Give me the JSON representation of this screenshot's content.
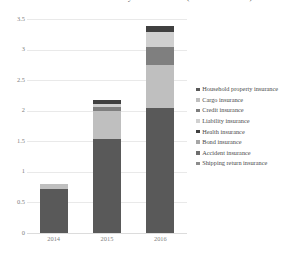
{
  "chart_data": {
    "type": "bar",
    "subtype": "stacked-column",
    "title": "Gross Premium Income by Insurance Line (RMB 100 million)",
    "xlabel": "",
    "ylabel": "",
    "categories": [
      "2014",
      "2015",
      "2016"
    ],
    "ylim": [
      0,
      3.5
    ],
    "yticks": [
      0,
      0.5,
      1,
      1.5,
      2,
      2.5,
      3,
      3.5
    ],
    "ytick_labels": [
      "0",
      "0.5",
      "1",
      "1.5",
      "2",
      "2.5",
      "3",
      "3.5"
    ],
    "grid": true,
    "legend_position": "right",
    "series": [
      {
        "name": "Household property insurance",
        "color": "#595959",
        "values": [
          0.72,
          1.53,
          2.05
        ]
      },
      {
        "name": "Cargo insurance",
        "color": "#bfbfbf",
        "values": [
          0.08,
          0.47,
          0.7
        ]
      },
      {
        "name": "Credit insurance",
        "color": "#7f7f7f",
        "values": [
          0.0,
          0.06,
          0.3
        ]
      },
      {
        "name": "Liability insurance",
        "color": "#d0d0d0",
        "values": [
          0.0,
          0.05,
          0.23
        ]
      },
      {
        "name": "Health insurance",
        "color": "#404040",
        "values": [
          0.0,
          0.07,
          0.11
        ]
      },
      {
        "name": "Bond insurance",
        "color": "#a6a6a6",
        "values": [
          0.0,
          0.0,
          0.0
        ]
      },
      {
        "name": "Accident insurance",
        "color": "#6e6e6e",
        "values": [
          0.0,
          0.0,
          0.0
        ]
      },
      {
        "name": "Shipping return insurance",
        "color": "#8c8c8c",
        "values": [
          0.0,
          0.0,
          0.0
        ]
      }
    ],
    "totals": [
      0.8,
      2.18,
      3.39
    ]
  },
  "legend": {
    "items": [
      {
        "label": "Household property insurance",
        "marker": "square-marker"
      },
      {
        "label": "Cargo insurance",
        "marker": "square-marker"
      },
      {
        "label": "Credit insurance",
        "marker": "square-marker"
      },
      {
        "label": "Liability insurance",
        "marker": "square-marker"
      },
      {
        "label": "Health insurance",
        "marker": "square-marker"
      },
      {
        "label": "Bond insurance",
        "marker": "square-marker"
      },
      {
        "label": "Accident insurance",
        "marker": "square-marker"
      },
      {
        "label": "Shipping return insurance",
        "marker": "square-marker"
      }
    ]
  },
  "colors": {
    "grid": "#e9e9e9",
    "axis_text": "#808080",
    "legend_text": "#4a4a4a",
    "background": "#ffffff"
  }
}
